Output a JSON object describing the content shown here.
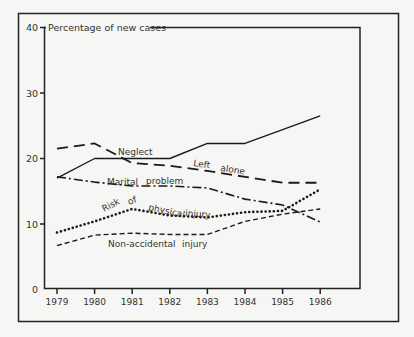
{
  "chart_data": {
    "type": "line",
    "title": "Percentage of new cases",
    "xlabel": "",
    "ylabel": "Percentage of new cases",
    "ylim": [
      0,
      40
    ],
    "yticks": [
      0,
      10,
      20,
      30,
      40
    ],
    "grid": false,
    "legend_position": "inline labels",
    "categories": [
      "1979",
      "1980",
      "1981",
      "1982",
      "1983",
      "1984",
      "1985",
      "1986"
    ],
    "series": [
      {
        "name": "Neglect",
        "style": "solid",
        "values": [
          17.0,
          20.0,
          20.0,
          20.0,
          22.3,
          22.3,
          24.4,
          26.5
        ]
      },
      {
        "name": "Left alone",
        "style": "long-dash",
        "values": [
          21.5,
          22.3,
          19.3,
          18.9,
          18.1,
          17.2,
          16.3,
          16.3
        ]
      },
      {
        "name": "Marital problem",
        "style": "dash-dot",
        "values": [
          17.2,
          16.4,
          15.8,
          15.8,
          15.5,
          13.8,
          12.9,
          10.3
        ]
      },
      {
        "name": "Risk of physical injury",
        "style": "dotted",
        "values": [
          8.7,
          10.4,
          12.3,
          11.3,
          11.0,
          11.8,
          12.0,
          15.3
        ]
      },
      {
        "name": "Non-accidental injury",
        "style": "short-dash",
        "values": [
          6.7,
          8.3,
          8.6,
          8.4,
          8.4,
          10.4,
          11.5,
          12.3
        ]
      }
    ],
    "annotations": [
      {
        "text": "Neglect",
        "x": 118,
        "y": 155,
        "rotate": 0
      },
      {
        "text": "Left",
        "x": 193,
        "y": 166,
        "rotate": 8
      },
      {
        "text": "alone",
        "x": 220,
        "y": 171,
        "rotate": 8
      },
      {
        "text": "Marital",
        "x": 107,
        "y": 185,
        "rotate": 0
      },
      {
        "text": "problem",
        "x": 146,
        "y": 184,
        "rotate": 0
      },
      {
        "text": "Risk",
        "x": 104,
        "y": 212,
        "rotate": -28
      },
      {
        "text": "of",
        "x": 129,
        "y": 205,
        "rotate": -20
      },
      {
        "text": "physical",
        "x": 148,
        "y": 210,
        "rotate": 12
      },
      {
        "text": "injury",
        "x": 185,
        "y": 216,
        "rotate": 4
      },
      {
        "text": "Non-accidental",
        "x": 108,
        "y": 247,
        "rotate": 0
      },
      {
        "text": "injury",
        "x": 182,
        "y": 247,
        "rotate": 0
      }
    ]
  }
}
